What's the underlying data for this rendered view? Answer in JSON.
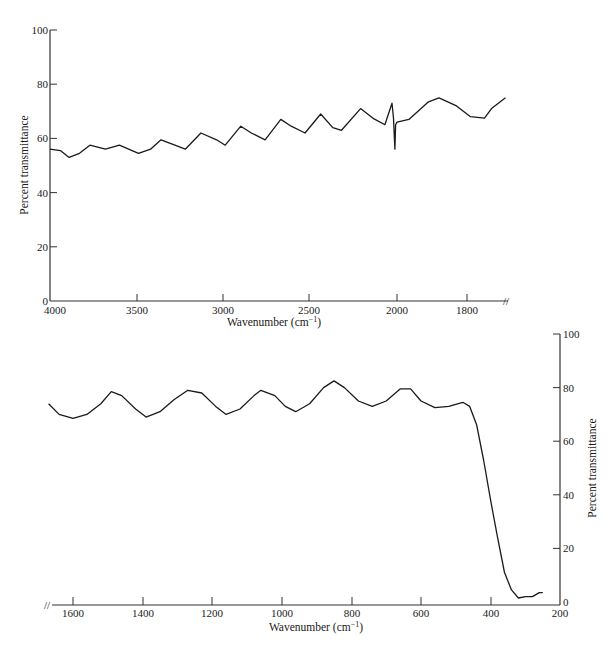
{
  "chart_data": [
    {
      "type": "line",
      "title": "",
      "xlabel": "Wavenumber (cm⁻¹)",
      "ylabel": "Percent transmittance",
      "xlim": [
        4000,
        1700
      ],
      "ylim": [
        0,
        100
      ],
      "x_ticks": [
        "4000",
        "3500",
        "3000",
        "2500",
        "2000",
        "1800"
      ],
      "y_ticks": [
        "0",
        "20",
        "40",
        "60",
        "80",
        "100"
      ],
      "axis_break": "//",
      "ylabel_position": "left",
      "grid": false,
      "series": [
        {
          "name": "IR transmittance (high wavenumber)",
          "x": [
            4000,
            3940,
            3890,
            3830,
            3770,
            3680,
            3600,
            3490,
            3420,
            3360,
            3280,
            3220,
            3130,
            3040,
            2990,
            2900,
            2840,
            2760,
            2670,
            2610,
            2530,
            2440,
            2370,
            2320,
            2210,
            2140,
            2070,
            2100,
            2020,
            2012,
            2008,
            2000,
            1966,
            1910,
            1880,
            1830,
            1790,
            1750,
            1730,
            1690
          ],
          "y": [
            56,
            55.5,
            53,
            54.5,
            57.5,
            56,
            57.5,
            54.5,
            56,
            59.5,
            57.5,
            56,
            62,
            59.5,
            57.5,
            64.5,
            62,
            59.5,
            67,
            64.5,
            62,
            69,
            64,
            63,
            71,
            67.5,
            65,
            73,
            67.5,
            56,
            65,
            66,
            67,
            73.5,
            75,
            72,
            68,
            67.5,
            71,
            75
          ]
        }
      ]
    },
    {
      "type": "line",
      "title": "",
      "xlabel": "Wavenumber (cm⁻¹)",
      "ylabel": "Percent transmittance",
      "xlim": [
        1670,
        200
      ],
      "ylim": [
        0,
        100
      ],
      "x_ticks": [
        "1600",
        "1400",
        "1200",
        "1000",
        "800",
        "600",
        "400",
        "200"
      ],
      "y_ticks": [
        "0",
        "20",
        "40",
        "60",
        "80",
        "100"
      ],
      "axis_break": "//",
      "ylabel_position": "right",
      "grid": false,
      "series": [
        {
          "name": "IR transmittance (low wavenumber)",
          "x": [
            1670,
            1640,
            1600,
            1560,
            1520,
            1490,
            1460,
            1420,
            1390,
            1350,
            1310,
            1270,
            1230,
            1190,
            1160,
            1120,
            1080,
            1060,
            1020,
            990,
            960,
            920,
            880,
            850,
            820,
            780,
            740,
            700,
            660,
            630,
            600,
            560,
            520,
            480,
            460,
            440,
            420,
            400,
            380,
            360,
            340,
            320,
            300,
            280,
            260,
            250
          ],
          "y": [
            74,
            70,
            68.5,
            70,
            74,
            78.5,
            77,
            72,
            69,
            71,
            75.5,
            79,
            78,
            73,
            70,
            72,
            77,
            79,
            77,
            73,
            71,
            74,
            80,
            82.5,
            80,
            75,
            73,
            75,
            79.5,
            79.5,
            75,
            72.5,
            73,
            74.5,
            73,
            66,
            53,
            38,
            24,
            11,
            4.5,
            1.5,
            2,
            2,
            3.5,
            3.5
          ]
        }
      ]
    }
  ],
  "top_chart": {
    "ylabel": "Percent transmittance",
    "xlabel_main": "Wavenumber (cm",
    "xlabel_sup": "−1",
    "xlabel_close": ")",
    "y_ticks": [
      {
        "label": "0",
        "value": 0
      },
      {
        "label": "20",
        "value": 20
      },
      {
        "label": "40",
        "value": 40
      },
      {
        "label": "60",
        "value": 60
      },
      {
        "label": "80",
        "value": 80
      },
      {
        "label": "100",
        "value": 100
      }
    ],
    "x_ticks": [
      {
        "label": "4000",
        "px": 55
      },
      {
        "label": "3500",
        "px": 137
      },
      {
        "label": "3000",
        "px": 223
      },
      {
        "label": "2500",
        "px": 309
      },
      {
        "label": "2000",
        "px": 397
      },
      {
        "label": "1800",
        "px": 467
      }
    ],
    "break_mark": "//"
  },
  "bottom_chart": {
    "ylabel": "Percent transmittance",
    "xlabel_main": "Wavenumber (cm",
    "xlabel_sup": "−1",
    "xlabel_close": ")",
    "y_ticks": [
      {
        "label": "0",
        "value": 0
      },
      {
        "label": "20",
        "value": 20
      },
      {
        "label": "40",
        "value": 40
      },
      {
        "label": "60",
        "value": 60
      },
      {
        "label": "80",
        "value": 80
      },
      {
        "label": "100",
        "value": 100
      }
    ],
    "x_ticks": [
      {
        "label": "1600",
        "px": 73
      },
      {
        "label": "1400",
        "px": 143
      },
      {
        "label": "1200",
        "px": 212
      },
      {
        "label": "1000",
        "px": 282
      },
      {
        "label": "800",
        "px": 352
      },
      {
        "label": "600",
        "px": 421
      },
      {
        "label": "400",
        "px": 491
      },
      {
        "label": "200",
        "px": 560
      }
    ],
    "break_mark": "//"
  },
  "colors": {
    "line": "#1a1a1a",
    "axis": "#333333",
    "background": "#ffffff"
  }
}
